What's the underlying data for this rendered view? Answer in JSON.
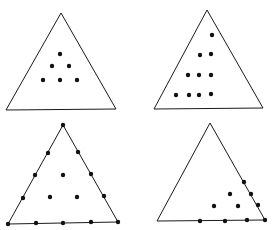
{
  "figure": {
    "width": 272,
    "height": 230,
    "colors": {
      "stroke": "#1a1a1a",
      "dot": "#111111",
      "background": "#ffffff"
    },
    "dot_radius": 2.2,
    "panels": [
      {
        "id": "top-left",
        "description": "triangle with 6 interior dots arranged 1-2-3",
        "vertices": [
          [
            61,
            13
          ],
          [
            6,
            110
          ],
          [
            116,
            109
          ]
        ],
        "dots": [
          [
            60,
            54
          ],
          [
            52,
            66
          ],
          [
            69,
            66
          ],
          [
            43,
            80
          ],
          [
            60,
            80
          ],
          [
            77,
            80
          ]
        ]
      },
      {
        "id": "top-right",
        "description": "triangle with 10 interior dots right-aligned 1-2-3-4",
        "vertices": [
          [
            207,
            10
          ],
          [
            154,
            109
          ],
          [
            263,
            108
          ]
        ],
        "dots": [
          [
            212,
            35
          ],
          [
            200,
            55
          ],
          [
            211,
            54
          ],
          [
            188,
            75
          ],
          [
            199,
            75
          ],
          [
            211,
            75
          ],
          [
            176,
            95
          ],
          [
            189,
            95
          ],
          [
            199,
            95
          ],
          [
            211,
            94
          ]
        ]
      },
      {
        "id": "bottom-left",
        "description": "triangle with 15 dots on a lattice, including vertices and edges",
        "vertices": [
          [
            63,
            125
          ],
          [
            8,
            224
          ],
          [
            118,
            222
          ]
        ],
        "dots": [
          [
            63,
            125
          ],
          [
            48,
            153
          ],
          [
            78,
            152
          ],
          [
            35,
            175
          ],
          [
            63,
            175
          ],
          [
            91,
            174
          ],
          [
            23,
            198
          ],
          [
            50,
            197
          ],
          [
            77,
            197
          ],
          [
            104,
            196
          ],
          [
            8,
            224
          ],
          [
            36,
            223
          ],
          [
            63,
            223
          ],
          [
            91,
            222
          ],
          [
            118,
            222
          ]
        ]
      },
      {
        "id": "bottom-right",
        "description": "triangle with 10 dots clustered at the bottom-right corner",
        "vertices": [
          [
            210,
            123
          ],
          [
            157,
            221
          ],
          [
            265,
            220
          ]
        ],
        "dots": [
          [
            244,
            182
          ],
          [
            230,
            194
          ],
          [
            251,
            194
          ],
          [
            214,
            206
          ],
          [
            238,
            206
          ],
          [
            258,
            205
          ],
          [
            200,
            221
          ],
          [
            225,
            221
          ],
          [
            247,
            220
          ],
          [
            265,
            220
          ]
        ]
      }
    ]
  }
}
